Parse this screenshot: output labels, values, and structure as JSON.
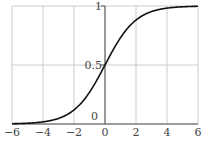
{
  "chart_data": {
    "type": "line",
    "title": "",
    "xlabel": "",
    "ylabel": "",
    "xlim": [
      -6,
      6
    ],
    "ylim": [
      0,
      1
    ],
    "grid": true,
    "x_ticks": [
      -6,
      -4,
      -2,
      0,
      2,
      4,
      6
    ],
    "x_tick_labels": [
      "−6",
      "−4",
      "−2",
      "0",
      "2",
      "4",
      "6"
    ],
    "y_ticks": [
      0,
      0.5,
      1
    ],
    "y_tick_labels": [
      "0",
      "0.5",
      "1"
    ],
    "series": [
      {
        "name": "sigmoid",
        "function": "1/(1+exp(-x))",
        "x": [
          -6,
          -5,
          -4,
          -3,
          -2,
          -1,
          0,
          1,
          2,
          3,
          4,
          5,
          6
        ],
        "y": [
          0.002,
          0.007,
          0.018,
          0.047,
          0.119,
          0.269,
          0.5,
          0.731,
          0.881,
          0.953,
          0.982,
          0.993,
          0.998
        ]
      }
    ],
    "colors": {
      "line": "#111111",
      "grid": "#cccccc",
      "axis": "#555555"
    }
  }
}
